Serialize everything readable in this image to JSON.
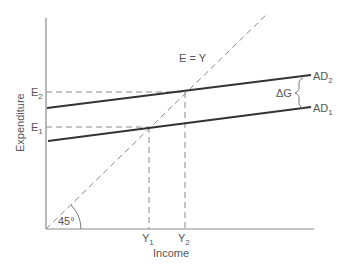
{
  "diagram": {
    "title": "",
    "axes": {
      "x_label": "Income",
      "y_label": "Expenditure"
    },
    "lines": {
      "forty_five": {
        "label": "E = Y",
        "angle_label": "45°"
      },
      "ad1": {
        "label": "AD",
        "sub": "1"
      },
      "ad2": {
        "label": "AD",
        "sub": "2"
      }
    },
    "shift_label": "ΔG",
    "y_ticks": [
      {
        "label": "E",
        "sub": "1"
      },
      {
        "label": "E",
        "sub": "2"
      }
    ],
    "x_ticks": [
      {
        "label": "Y",
        "sub": "1"
      },
      {
        "label": "Y",
        "sub": "2"
      }
    ],
    "colors": {
      "axis": "#8a8a8a",
      "ad_lines": "#333333",
      "text": "#555555"
    }
  }
}
